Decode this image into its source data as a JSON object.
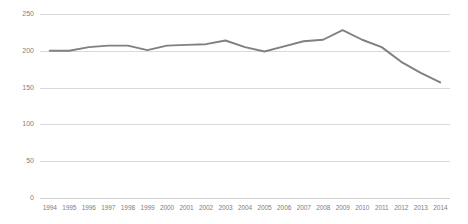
{
  "chart_data": {
    "type": "line",
    "title": "",
    "subtitle": "",
    "xlabel": "",
    "ylabel": "",
    "categories": [
      "1994",
      "1995",
      "1996",
      "1997",
      "1998",
      "1999",
      "2000",
      "2001",
      "2002",
      "2003",
      "2004",
      "2005",
      "2006",
      "2007",
      "2008",
      "2009",
      "2010",
      "2011",
      "2012",
      "2013",
      "2014"
    ],
    "series": [
      {
        "name": "series-1",
        "color": "#808080",
        "values": [
          200,
          200,
          205,
          207,
          207,
          201,
          207,
          208,
          209,
          214,
          205,
          199,
          206,
          213,
          215,
          228,
          215,
          205,
          185,
          170,
          157
        ]
      }
    ],
    "ylim": [
      0,
      250
    ],
    "yticks": [
      0,
      50,
      100,
      150,
      200,
      250
    ],
    "ytick_labels": [
      "0",
      "50",
      "100",
      "150",
      "200",
      "250"
    ],
    "grid": true,
    "grid_axis": "y",
    "grid_color": "#d9d9d9",
    "legend": false,
    "legend_position": "none",
    "markers": false,
    "annotations": []
  },
  "style": {
    "background": "#ffffff",
    "tick_label_color": "#808080",
    "line_color": "#808080"
  }
}
